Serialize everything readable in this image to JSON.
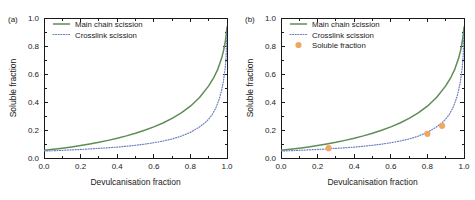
{
  "figure": {
    "background": "#ffffff",
    "width": 475,
    "height": 200
  },
  "colors": {
    "main_chain": "#5f8c57",
    "crosslink": "#6e7fc0",
    "soluble_marker": "#f0a860",
    "axis": "#1a1a1a",
    "text": "#1a1a1a"
  },
  "panels": [
    {
      "label": "(a)",
      "xlabel": "Devulcanisation fraction",
      "ylabel": "Soluble fraction",
      "xticks": [
        "0.0",
        "0.2",
        "0.4",
        "0.6",
        "0.8",
        "1.0"
      ],
      "yticks": [
        "0.0",
        "0.2",
        "0.4",
        "0.6",
        "0.8",
        "1.0"
      ],
      "legend": [
        {
          "label": "Main chain scission",
          "type": "line",
          "color": "#5f8c57"
        },
        {
          "label": "Crosslink scission",
          "type": "dotted",
          "color": "#6e7fc0"
        }
      ]
    },
    {
      "label": "(b)",
      "xlabel": "Devulcanisation fraction",
      "ylabel": "Soluble fraction",
      "xticks": [
        "0.0",
        "0.2",
        "0.4",
        "0.6",
        "0.8",
        "1.0"
      ],
      "yticks": [
        "0.0",
        "0.2",
        "0.4",
        "0.6",
        "0.8",
        "1.0"
      ],
      "legend": [
        {
          "label": "Main chain scission",
          "type": "line",
          "color": "#5f8c57"
        },
        {
          "label": "Crosslink scission",
          "type": "dotted",
          "color": "#6e7fc0"
        },
        {
          "label": "Soluble fraction",
          "type": "marker",
          "color": "#f0a860"
        }
      ]
    }
  ],
  "chart_data": [
    {
      "type": "line",
      "panel": "(a)",
      "title": "",
      "xlabel": "Devulcanisation fraction",
      "ylabel": "Soluble fraction",
      "xlim": [
        0.0,
        1.0
      ],
      "ylim": [
        0.0,
        1.0
      ],
      "grid": false,
      "legend_position": "top-left",
      "series": [
        {
          "name": "Main chain scission",
          "style": "solid",
          "color": "#5f8c57",
          "x": [
            0.0,
            0.05,
            0.1,
            0.15,
            0.2,
            0.25,
            0.3,
            0.35,
            0.4,
            0.45,
            0.5,
            0.55,
            0.6,
            0.65,
            0.7,
            0.75,
            0.8,
            0.85,
            0.9,
            0.93,
            0.95,
            0.97,
            0.98,
            0.99,
            0.995,
            1.0
          ],
          "y": [
            0.055,
            0.062,
            0.07,
            0.079,
            0.089,
            0.1,
            0.112,
            0.126,
            0.141,
            0.158,
            0.177,
            0.198,
            0.222,
            0.25,
            0.283,
            0.322,
            0.37,
            0.432,
            0.515,
            0.58,
            0.635,
            0.71,
            0.76,
            0.825,
            0.875,
            0.935
          ]
        },
        {
          "name": "Crosslink scission",
          "style": "dotted",
          "color": "#6e7fc0",
          "x": [
            0.0,
            0.05,
            0.1,
            0.15,
            0.2,
            0.25,
            0.3,
            0.35,
            0.4,
            0.45,
            0.5,
            0.55,
            0.6,
            0.65,
            0.7,
            0.75,
            0.8,
            0.85,
            0.88,
            0.9,
            0.92,
            0.94,
            0.96,
            0.97,
            0.98,
            0.99,
            0.995,
            1.0
          ],
          "y": [
            0.05,
            0.052,
            0.055,
            0.058,
            0.061,
            0.065,
            0.069,
            0.073,
            0.078,
            0.084,
            0.091,
            0.099,
            0.109,
            0.121,
            0.136,
            0.156,
            0.183,
            0.222,
            0.252,
            0.278,
            0.312,
            0.36,
            0.43,
            0.48,
            0.545,
            0.64,
            0.72,
            0.9
          ]
        }
      ]
    },
    {
      "type": "line",
      "panel": "(b)",
      "title": "",
      "xlabel": "Devulcanisation fraction",
      "ylabel": "Soluble fraction",
      "xlim": [
        0.0,
        1.0
      ],
      "ylim": [
        0.0,
        1.0
      ],
      "grid": false,
      "legend_position": "top-left",
      "series": [
        {
          "name": "Main chain scission",
          "style": "solid",
          "color": "#5f8c57",
          "x": [
            0.0,
            0.05,
            0.1,
            0.15,
            0.2,
            0.25,
            0.3,
            0.35,
            0.4,
            0.45,
            0.5,
            0.55,
            0.6,
            0.65,
            0.7,
            0.75,
            0.8,
            0.85,
            0.9,
            0.93,
            0.95,
            0.97,
            0.98,
            0.99,
            0.995,
            1.0
          ],
          "y": [
            0.055,
            0.062,
            0.07,
            0.079,
            0.089,
            0.1,
            0.112,
            0.126,
            0.141,
            0.158,
            0.177,
            0.198,
            0.222,
            0.25,
            0.283,
            0.322,
            0.37,
            0.432,
            0.515,
            0.58,
            0.635,
            0.71,
            0.76,
            0.825,
            0.875,
            0.935
          ]
        },
        {
          "name": "Crosslink scission",
          "style": "dotted",
          "color": "#6e7fc0",
          "x": [
            0.0,
            0.05,
            0.1,
            0.15,
            0.2,
            0.25,
            0.3,
            0.35,
            0.4,
            0.45,
            0.5,
            0.55,
            0.6,
            0.65,
            0.7,
            0.75,
            0.8,
            0.85,
            0.88,
            0.9,
            0.92,
            0.94,
            0.96,
            0.97,
            0.98,
            0.99,
            0.995,
            1.0
          ],
          "y": [
            0.05,
            0.052,
            0.055,
            0.058,
            0.061,
            0.065,
            0.069,
            0.073,
            0.078,
            0.084,
            0.091,
            0.099,
            0.109,
            0.121,
            0.136,
            0.156,
            0.183,
            0.222,
            0.252,
            0.278,
            0.312,
            0.36,
            0.43,
            0.48,
            0.545,
            0.64,
            0.72,
            0.9
          ]
        },
        {
          "name": "Soluble fraction",
          "style": "marker",
          "color": "#f0a860",
          "x": [
            0.26,
            0.8,
            0.88
          ],
          "y": [
            0.07,
            0.173,
            0.23
          ]
        }
      ]
    }
  ]
}
